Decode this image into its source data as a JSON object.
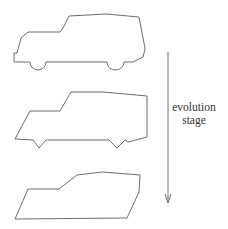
{
  "diagram": {
    "stroke_color": "#6e6e6e",
    "arrow_label_line1": "evolution",
    "arrow_label_line2": "stage",
    "stages": [
      {
        "name": "car-stage-1",
        "description": "detailed SUV outline with rounded wheel arches"
      },
      {
        "name": "car-stage-2",
        "description": "simplified SUV outline with angular wheel notches"
      },
      {
        "name": "car-stage-3",
        "description": "simplified car outline without wheels"
      }
    ],
    "arrow": {
      "direction": "down"
    }
  }
}
